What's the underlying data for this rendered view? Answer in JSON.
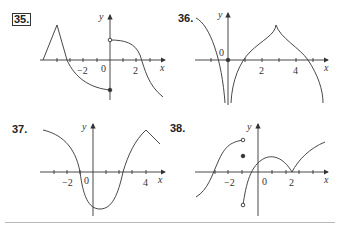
{
  "problems": [
    {
      "number": "35.",
      "boxed": true,
      "x_tick_labels": [
        "-2",
        "0",
        "2"
      ],
      "axis_labels": {
        "x": "x",
        "y": "y"
      },
      "features": [
        "triangle peak",
        "closed dot at (0,-2)",
        "open circle at (0,1.5)"
      ]
    },
    {
      "number": "36.",
      "boxed": false,
      "x_tick_labels": [
        "0",
        "2",
        "4"
      ],
      "axis_labels": {
        "x": "x",
        "y": "y"
      },
      "features": [
        "vertical asymptote at x=0",
        "closed dot at origin",
        "cusp at x=3"
      ]
    },
    {
      "number": "37.",
      "boxed": false,
      "x_tick_labels": [
        "-2",
        "0",
        "4"
      ],
      "axis_labels": {
        "x": "x",
        "y": "y"
      },
      "features": [
        "minimum near x=0.5",
        "corner at x=4"
      ]
    },
    {
      "number": "38.",
      "boxed": false,
      "x_tick_labels": [
        "-2",
        "0",
        "2"
      ],
      "axis_labels": {
        "x": "x",
        "y": "y"
      },
      "features": [
        "open circles at x=-1",
        "closed dot at (-1,1.3)",
        "cusp at x=2"
      ]
    }
  ]
}
